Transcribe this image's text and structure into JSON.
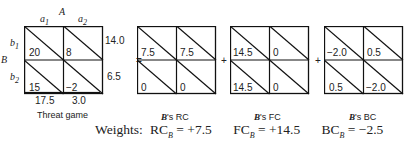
{
  "threat_game": {
    "player_A_label": "A",
    "player_B_label": "B",
    "col_labels": [
      "a1",
      "a2"
    ],
    "row_labels": [
      "b1",
      "b2"
    ],
    "cells": [
      [
        "20",
        "8"
      ],
      [
        "15",
        "−2"
      ]
    ],
    "row_sums": [
      "14.0",
      "6.5"
    ],
    "col_sums": [
      "17.5",
      "3.0"
    ],
    "caption": "Threat game"
  },
  "operators": [
    "=",
    "+",
    "+"
  ],
  "components": [
    {
      "caption_prefix": "B",
      "caption_suffix": "'s RC",
      "cells": [
        [
          "7.5",
          "7.5"
        ],
        [
          "0",
          "0"
        ]
      ]
    },
    {
      "caption_prefix": "B",
      "caption_suffix": "'s FC",
      "cells": [
        [
          "14.5",
          "0"
        ],
        [
          "14.5",
          "0"
        ]
      ]
    },
    {
      "caption_prefix": "B",
      "caption_suffix": "'s BC",
      "cells": [
        [
          "−2.0",
          "0.5"
        ],
        [
          "0.5",
          "−2.0"
        ]
      ]
    }
  ],
  "weights": {
    "label": "Weights:",
    "items": [
      {
        "name": "RC",
        "sub": "B",
        "value": "= +7.5"
      },
      {
        "name": "FC",
        "sub": "B",
        "value": "= +14.5"
      },
      {
        "name": "BC",
        "sub": "B",
        "value": "= −2.5"
      }
    ]
  }
}
